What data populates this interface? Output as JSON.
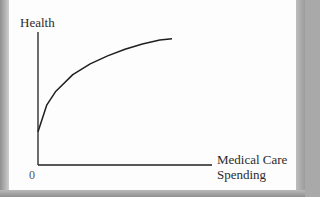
{
  "chart_data": {
    "type": "line",
    "title": "",
    "xlabel": "Medical Care Spending",
    "xlabel_lines": [
      "Medical Care",
      "Spending"
    ],
    "ylabel": "Health",
    "origin_label": "0",
    "grid": false,
    "legend": null,
    "xlim": [
      0,
      1
    ],
    "ylim": [
      0,
      1
    ],
    "series": [
      {
        "name": "Health production function",
        "shape": "concave, increasing at a diminishing rate",
        "x": [
          0,
          0.05,
          0.1,
          0.2,
          0.3,
          0.4,
          0.5,
          0.6,
          0.7,
          0.77
        ],
        "y": [
          0.25,
          0.45,
          0.55,
          0.68,
          0.76,
          0.82,
          0.87,
          0.91,
          0.94,
          0.95
        ]
      }
    ],
    "colors": {
      "curve": "#1f1f1f",
      "axes": "#1f1f1f",
      "background": "#fdfdfd"
    }
  },
  "labels": {
    "y_axis": "Health",
    "origin": "0",
    "x_axis_line1": "Medical Care",
    "x_axis_line2": "Spending"
  }
}
